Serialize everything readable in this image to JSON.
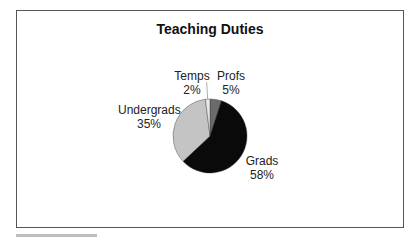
{
  "chart_data": {
    "type": "pie",
    "title": "Teaching Duties",
    "categories": [
      "Profs",
      "Grads",
      "Undergrads",
      "Temps"
    ],
    "values": [
      5,
      58,
      35,
      2
    ],
    "value_labels": [
      "5%",
      "58%",
      "35%",
      "2%"
    ],
    "colors": [
      "#6b6b6b",
      "#0a0a0a",
      "#c4c4c4",
      "#e6e6e6"
    ],
    "start_angle": "12 o'clock, clockwise",
    "legend": "none (data labels beside slices)"
  },
  "labels": {
    "profs": {
      "name": "Profs",
      "pct": "5%"
    },
    "grads": {
      "name": "Grads",
      "pct": "58%"
    },
    "undergrads": {
      "name": "Undergrads",
      "pct": "35%"
    },
    "temps": {
      "name": "Temps",
      "pct": "2%"
    }
  }
}
